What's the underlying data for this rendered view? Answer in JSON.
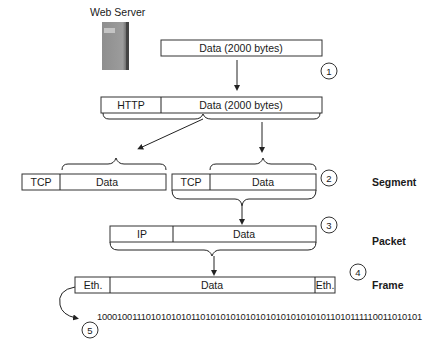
{
  "server": {
    "label": "Web Server",
    "icon": "server-icon"
  },
  "rows": {
    "app_data": {
      "data_label": "Data (2000 bytes)",
      "step": "1"
    },
    "http": {
      "header_label": "HTTP",
      "data_label": "Data (2000 bytes)"
    },
    "segment": {
      "header_label": "TCP",
      "data_label": "Data",
      "header_label_2": "TCP",
      "data_label_2": "Data",
      "step": "2",
      "name": "Segment"
    },
    "packet": {
      "header_label": "IP",
      "data_label": "Data",
      "step": "3",
      "name": "Packet"
    },
    "frame": {
      "header_label": "Eth.",
      "data_label": "Data",
      "trailer_label": "Eth.",
      "step": "4",
      "name": "Frame"
    },
    "bits": {
      "value": "100010011101010101011010101010101010101010101011010111110011010101",
      "step": "5"
    }
  }
}
